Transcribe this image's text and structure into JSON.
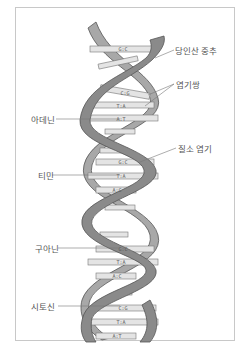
{
  "diagram": {
    "colors": {
      "backbone_front": "#8a8a8a",
      "backbone_back": "#a8a8a8",
      "backbone_edge": "#555555",
      "base_bar": "#e4e4e4",
      "label_text": "#555555",
      "leader_line": "#777777",
      "frame_border": "#c8c8c8"
    },
    "labels": {
      "backbone": "당인산 중추",
      "base_pair": "염기쌍",
      "adenine": "아데닌",
      "nitrogen_base": "질소 염기",
      "thymine": "티민",
      "guanine": "구아닌",
      "cytosine": "시토신"
    },
    "base_pairs": [
      {
        "text": "G:C",
        "y": 49
      },
      {
        "text": "C:G",
        "y": 92
      },
      {
        "text": "T:A",
        "y": 105
      },
      {
        "text": "A:T",
        "y": 118
      },
      {
        "text": "G:C",
        "y": 162
      },
      {
        "text": "T:A",
        "y": 176
      },
      {
        "text": "A:C",
        "y": 190
      },
      {
        "text": "G:C",
        "y": 249
      },
      {
        "text": "T:A",
        "y": 262
      },
      {
        "text": "A:C",
        "y": 276
      },
      {
        "text": "C:G",
        "y": 308
      },
      {
        "text": "T:A",
        "y": 322
      },
      {
        "text": "A:T",
        "y": 336
      }
    ]
  }
}
